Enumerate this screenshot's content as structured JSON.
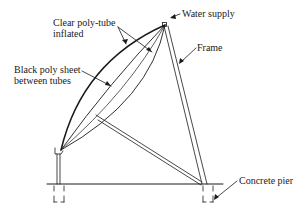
{
  "diagram": {
    "type": "solar collector frame schematic",
    "labels": {
      "clear_tube": [
        "Clear poly-tube",
        "inflated"
      ],
      "black_sheet": [
        "Black poly sheet",
        "between tubes"
      ],
      "water_supply": "Water supply",
      "frame": "Frame",
      "concrete_pier": "Concrete pier"
    },
    "colors": {
      "line": "#1a1a1a",
      "background": "#ffffff"
    }
  }
}
